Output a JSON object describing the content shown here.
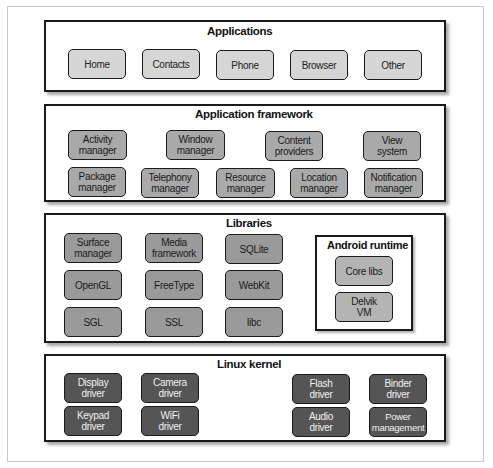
{
  "diagram": {
    "layers": [
      {
        "title": "Applications",
        "components": [
          "Home",
          "Contacts",
          "Phone",
          "Browser",
          "Other"
        ]
      },
      {
        "title": "Application framework",
        "components": [
          "Activity manager",
          "Window manager",
          "Content providers",
          "View system",
          "Package manager",
          "Telephony manager",
          "Resource manager",
          "Location manager",
          "Notification manager"
        ]
      },
      {
        "title": "Libraries",
        "components": [
          "Surface manager",
          "Media framework",
          "SQLite",
          "OpenGL",
          "FreeType",
          "WebKit",
          "SGL",
          "SSL",
          "libc"
        ],
        "runtime": {
          "title": "Android runtime",
          "components": [
            "Core libs",
            "Delvik VM"
          ]
        }
      },
      {
        "title": "Linux kernel",
        "components": [
          "Display driver",
          "Camera driver",
          "Flash driver",
          "Binder driver",
          "Keypad driver",
          "WiFi driver",
          "Audio driver",
          "Power management"
        ]
      }
    ],
    "colors": {
      "app_box": "#d6d6d6",
      "framework_box": "#a9a9a9",
      "library_box": "#9a9a9a",
      "runtime_box": "#b4b4b4",
      "kernel_box": "#555555",
      "border": "#1a1a1a"
    }
  }
}
